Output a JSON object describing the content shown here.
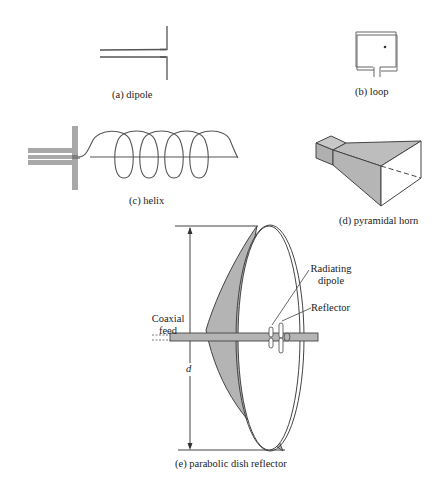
{
  "figure": {
    "panels": [
      {
        "id": "a",
        "caption": "(a)  dipole"
      },
      {
        "id": "b",
        "caption": "(b)  loop"
      },
      {
        "id": "c",
        "caption": "(c)  helix"
      },
      {
        "id": "d",
        "caption": "(d)  pyramidal horn"
      },
      {
        "id": "e",
        "caption": "(e)  parabolic dish reflector"
      }
    ],
    "dish_labels": {
      "coaxial_feed_line1": "Coaxial",
      "coaxial_feed_line2": "feed",
      "radiating_dipole_line1": "Radiating",
      "radiating_dipole_line2": "dipole",
      "reflector": "Reflector",
      "diameter": "d"
    },
    "colors": {
      "line": "#555555",
      "fill_gray": "#b8b8b8",
      "background": "#ffffff"
    }
  }
}
